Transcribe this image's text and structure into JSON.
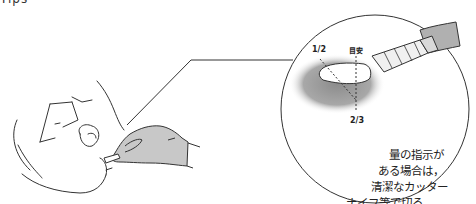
{
  "header": {
    "cut_off_text": "Tips"
  },
  "detail_circle": {
    "labels": {
      "half": "1/2",
      "guide": "目安",
      "two_thirds": "2/3"
    },
    "caption_lines": [
      "量の指示が",
      "ある場合は，",
      "清潔なカッター",
      "ナイフ等で切る。"
    ]
  },
  "colors": {
    "line": "#333333",
    "glove": "#c8c8c8",
    "shadow": "#9a9a9a",
    "background": "#ffffff"
  }
}
